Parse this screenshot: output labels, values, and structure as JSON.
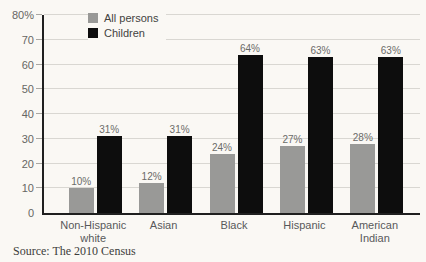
{
  "chart_data": {
    "type": "bar",
    "categories": [
      "Non-Hispanic white",
      "Asian",
      "Black",
      "Hispanic",
      "American Indian"
    ],
    "series": [
      {
        "name": "All persons",
        "color": "#999997",
        "values": [
          10,
          12,
          24,
          27,
          28
        ]
      },
      {
        "name": "Children",
        "color": "#0d0d0d",
        "values": [
          31,
          31,
          64,
          63,
          63
        ]
      }
    ],
    "value_suffix": "%",
    "ylim": [
      0,
      80
    ],
    "ytick_step": 10,
    "yticks": [
      "80%",
      "70",
      "60",
      "50",
      "40",
      "30",
      "20",
      "10",
      "0"
    ],
    "grid": true,
    "legend_position": "top-left",
    "xlabel": "",
    "ylabel": ""
  },
  "source": "Source: The 2010 Census"
}
